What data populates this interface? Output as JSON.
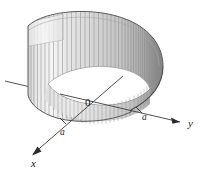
{
  "figure": {
    "type": "3d-solid-diagram",
    "background_color": "#ffffff"
  },
  "axes": {
    "x": {
      "label": "x",
      "direction": "lower-left",
      "arrow": true,
      "label_x": 31,
      "label_y": 167,
      "line": {
        "x1": 123,
        "y1": 76,
        "x2": 32,
        "y2": 155
      },
      "tick": {
        "label": "a",
        "label_x": 60,
        "label_y": 135,
        "point_x": 63,
        "point_y": 122
      }
    },
    "y": {
      "label": "y",
      "direction": "right",
      "arrow": true,
      "label_x": 188,
      "label_y": 127,
      "line": {
        "x1": 5,
        "y1": 81,
        "x2": 180,
        "y2": 122
      },
      "tick": {
        "label": "a",
        "label_x": 142,
        "label_y": 120,
        "point_x": 139,
        "point_y": 110
      }
    },
    "origin": {
      "label": "0",
      "label_x": 85,
      "label_y": 106
    }
  },
  "colors": {
    "surface_light": "#f2f2f2",
    "surface_mid": "#d8d8d8",
    "surface_dark": "#9c9c9c",
    "surface_darkest": "#6e6e6e",
    "ruling_line": "#8c8c8c",
    "outline": "#5a5a5a",
    "axis_line": "#3c3c3c",
    "inner_fill": "#ffffff",
    "text": "#1a1a1a"
  },
  "geometry": {
    "radius_label": "a",
    "top_rim_note": "elliptical top rim of cylinder",
    "bottom_curve_note": "saddle-shaped cut curve",
    "ruling_count": 44,
    "notch_note": "rectangular lighter panel at upper-left of cylinder wall"
  }
}
